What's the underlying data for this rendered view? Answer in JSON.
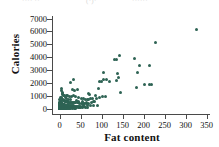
{
  "header_fragment": {
    "part_a": "···· ··",
    "part_b": "(·)·",
    "part_c": "······"
  },
  "chart_data": {
    "type": "scatter",
    "title": "",
    "xlabel": "Fat content",
    "ylabel": "Calories",
    "xlim": [
      -18,
      358
    ],
    "ylim": [
      -400,
      7200
    ],
    "xticks": [
      0,
      50,
      100,
      150,
      200,
      250,
      300,
      350
    ],
    "yticks": [
      0,
      1000,
      2000,
      3000,
      4000,
      5000,
      6000,
      7000
    ],
    "grid": false,
    "legend": false,
    "marker_color": "#2e6354",
    "marker_size": 3,
    "points": [
      [
        325,
        6150
      ],
      [
        228,
        5150
      ],
      [
        143,
        4150
      ],
      [
        135,
        3850
      ],
      [
        131,
        3800
      ],
      [
        178,
        3900
      ],
      [
        190,
        3350
      ],
      [
        213,
        3350
      ],
      [
        186,
        2800
      ],
      [
        105,
        2850
      ],
      [
        138,
        2750
      ],
      [
        100,
        2150
      ],
      [
        104,
        2300
      ],
      [
        112,
        2250
      ],
      [
        120,
        2150
      ],
      [
        135,
        2200
      ],
      [
        141,
        2400
      ],
      [
        96,
        2100
      ],
      [
        32,
        2250
      ],
      [
        27,
        2050
      ],
      [
        202,
        1900
      ],
      [
        213,
        1900
      ],
      [
        218,
        1900
      ],
      [
        183,
        1650
      ],
      [
        146,
        1250
      ],
      [
        92,
        1600
      ],
      [
        30,
        1500
      ],
      [
        36,
        1450
      ],
      [
        43,
        1500
      ],
      [
        68,
        1200
      ],
      [
        72,
        1150
      ],
      [
        86,
        1050
      ],
      [
        88,
        800
      ],
      [
        95,
        900
      ],
      [
        101,
        950
      ],
      [
        109,
        950
      ],
      [
        4,
        1550
      ],
      [
        5,
        1400
      ],
      [
        6,
        1300
      ],
      [
        7,
        1200
      ],
      [
        8,
        1150
      ],
      [
        10,
        1050
      ],
      [
        12,
        1000
      ],
      [
        16,
        1050
      ],
      [
        20,
        1000
      ],
      [
        24,
        980
      ],
      [
        28,
        960
      ],
      [
        33,
        1000
      ],
      [
        39,
        950
      ],
      [
        46,
        900
      ],
      [
        52,
        820
      ],
      [
        57,
        780
      ],
      [
        62,
        760
      ],
      [
        66,
        700
      ],
      [
        70,
        720
      ],
      [
        74,
        820
      ],
      [
        78,
        780
      ],
      [
        3,
        900
      ],
      [
        4,
        850
      ],
      [
        5,
        800
      ],
      [
        6,
        760
      ],
      [
        7,
        720
      ],
      [
        8,
        700
      ],
      [
        9,
        680
      ],
      [
        10,
        660
      ],
      [
        11,
        640
      ],
      [
        12,
        620
      ],
      [
        13,
        600
      ],
      [
        14,
        590
      ],
      [
        15,
        580
      ],
      [
        16,
        570
      ],
      [
        17,
        560
      ],
      [
        18,
        550
      ],
      [
        19,
        540
      ],
      [
        20,
        530
      ],
      [
        22,
        520
      ],
      [
        24,
        510
      ],
      [
        26,
        500
      ],
      [
        28,
        495
      ],
      [
        30,
        490
      ],
      [
        33,
        480
      ],
      [
        36,
        470
      ],
      [
        39,
        465
      ],
      [
        42,
        460
      ],
      [
        45,
        455
      ],
      [
        48,
        450
      ],
      [
        52,
        445
      ],
      [
        56,
        440
      ],
      [
        60,
        435
      ],
      [
        64,
        430
      ],
      [
        68,
        425
      ],
      [
        1,
        700
      ],
      [
        1.5,
        640
      ],
      [
        2,
        600
      ],
      [
        2.5,
        560
      ],
      [
        3,
        520
      ],
      [
        3.5,
        490
      ],
      [
        4,
        460
      ],
      [
        4.5,
        440
      ],
      [
        5,
        420
      ],
      [
        5.5,
        400
      ],
      [
        6,
        385
      ],
      [
        6.5,
        370
      ],
      [
        7,
        360
      ],
      [
        7.5,
        350
      ],
      [
        8,
        340
      ],
      [
        9,
        330
      ],
      [
        10,
        320
      ],
      [
        11,
        310
      ],
      [
        12,
        300
      ],
      [
        13,
        295
      ],
      [
        14,
        290
      ],
      [
        15,
        285
      ],
      [
        16,
        280
      ],
      [
        17,
        275
      ],
      [
        18,
        270
      ],
      [
        19,
        265
      ],
      [
        20,
        260
      ],
      [
        21,
        255
      ],
      [
        22,
        250
      ],
      [
        24,
        245
      ],
      [
        26,
        240
      ],
      [
        28,
        235
      ],
      [
        30,
        230
      ],
      [
        32,
        225
      ],
      [
        34,
        220
      ],
      [
        36,
        215
      ],
      [
        38,
        210
      ],
      [
        40,
        205
      ],
      [
        42,
        200
      ],
      [
        45,
        198
      ],
      [
        48,
        195
      ],
      [
        51,
        190
      ],
      [
        54,
        188
      ],
      [
        57,
        185
      ],
      [
        60,
        180
      ],
      [
        0.5,
        520
      ],
      [
        0.8,
        470
      ],
      [
        1,
        430
      ],
      [
        1.2,
        400
      ],
      [
        1.5,
        370
      ],
      [
        1.8,
        340
      ],
      [
        2,
        320
      ],
      [
        2.2,
        300
      ],
      [
        2.5,
        285
      ],
      [
        2.8,
        270
      ],
      [
        3,
        255
      ],
      [
        3.3,
        245
      ],
      [
        3.6,
        235
      ],
      [
        4,
        225
      ],
      [
        4.4,
        215
      ],
      [
        4.8,
        205
      ],
      [
        5.2,
        198
      ],
      [
        5.6,
        190
      ],
      [
        6,
        185
      ],
      [
        6.5,
        178
      ],
      [
        7,
        172
      ],
      [
        7.5,
        166
      ],
      [
        8,
        160
      ],
      [
        9,
        155
      ],
      [
        10,
        150
      ],
      [
        11,
        145
      ],
      [
        12,
        140
      ],
      [
        13,
        136
      ],
      [
        14,
        132
      ],
      [
        15,
        128
      ],
      [
        16,
        124
      ],
      [
        18,
        120
      ],
      [
        20,
        116
      ],
      [
        22,
        112
      ],
      [
        24,
        108
      ],
      [
        26,
        104
      ],
      [
        28,
        100
      ],
      [
        31,
        96
      ],
      [
        34,
        92
      ],
      [
        37,
        90
      ],
      [
        40,
        86
      ],
      [
        44,
        82
      ],
      [
        48,
        78
      ],
      [
        0.3,
        380
      ],
      [
        0.5,
        340
      ],
      [
        0.7,
        300
      ],
      [
        0.9,
        270
      ],
      [
        1.1,
        245
      ],
      [
        1.3,
        225
      ],
      [
        1.5,
        205
      ],
      [
        1.7,
        190
      ],
      [
        1.9,
        175
      ],
      [
        2.1,
        162
      ],
      [
        2.4,
        150
      ],
      [
        2.7,
        140
      ],
      [
        3,
        130
      ],
      [
        3.4,
        122
      ],
      [
        3.8,
        114
      ],
      [
        4.2,
        106
      ],
      [
        4.6,
        100
      ],
      [
        5,
        94
      ],
      [
        5.5,
        88
      ],
      [
        6,
        82
      ],
      [
        6.6,
        78
      ],
      [
        7.2,
        72
      ],
      [
        8,
        68
      ],
      [
        9,
        62
      ],
      [
        10,
        58
      ],
      [
        11,
        54
      ],
      [
        12,
        50
      ],
      [
        14,
        46
      ],
      [
        16,
        42
      ],
      [
        18,
        38
      ],
      [
        21,
        34
      ],
      [
        24,
        30
      ],
      [
        27,
        28
      ],
      [
        31,
        24
      ],
      [
        35,
        22
      ],
      [
        39,
        20
      ],
      [
        0.2,
        240
      ],
      [
        0.4,
        200
      ],
      [
        0.6,
        170
      ],
      [
        0.8,
        145
      ],
      [
        1,
        125
      ],
      [
        1.2,
        110
      ],
      [
        1.4,
        96
      ],
      [
        1.6,
        86
      ],
      [
        1.8,
        76
      ],
      [
        2,
        68
      ],
      [
        2.3,
        60
      ],
      [
        2.6,
        54
      ],
      [
        3,
        48
      ],
      [
        3.5,
        42
      ],
      [
        4,
        36
      ],
      [
        4.6,
        32
      ],
      [
        5.2,
        28
      ],
      [
        6,
        24
      ],
      [
        7,
        20
      ],
      [
        8,
        16
      ],
      [
        9.5,
        14
      ],
      [
        11,
        12
      ],
      [
        13,
        10
      ],
      [
        15,
        8
      ],
      [
        0.1,
        140
      ],
      [
        0.2,
        110
      ],
      [
        0.3,
        90
      ],
      [
        0.4,
        74
      ],
      [
        0.5,
        62
      ],
      [
        0.7,
        50
      ],
      [
        0.9,
        40
      ],
      [
        1.1,
        32
      ],
      [
        1.4,
        26
      ],
      [
        1.8,
        20
      ],
      [
        2.2,
        16
      ],
      [
        2.8,
        12
      ],
      [
        3.5,
        8
      ],
      [
        4.5,
        6
      ],
      [
        6,
        4
      ],
      [
        0.05,
        60
      ],
      [
        0.1,
        40
      ],
      [
        0.2,
        25
      ],
      [
        0.35,
        15
      ],
      [
        0.6,
        8
      ],
      [
        1,
        4
      ],
      [
        25,
        700
      ],
      [
        21,
        760
      ],
      [
        17,
        820
      ],
      [
        13,
        880
      ],
      [
        40,
        640
      ],
      [
        44,
        600
      ],
      [
        55,
        560
      ],
      [
        63,
        520
      ],
      [
        80,
        600
      ],
      [
        84,
        560
      ],
      [
        76,
        480
      ],
      [
        58,
        300
      ],
      [
        66,
        280
      ],
      [
        73,
        260
      ],
      [
        81,
        240
      ],
      [
        90,
        230
      ],
      [
        50,
        120
      ],
      [
        55,
        100
      ],
      [
        61,
        90
      ],
      [
        67,
        80
      ]
    ]
  }
}
